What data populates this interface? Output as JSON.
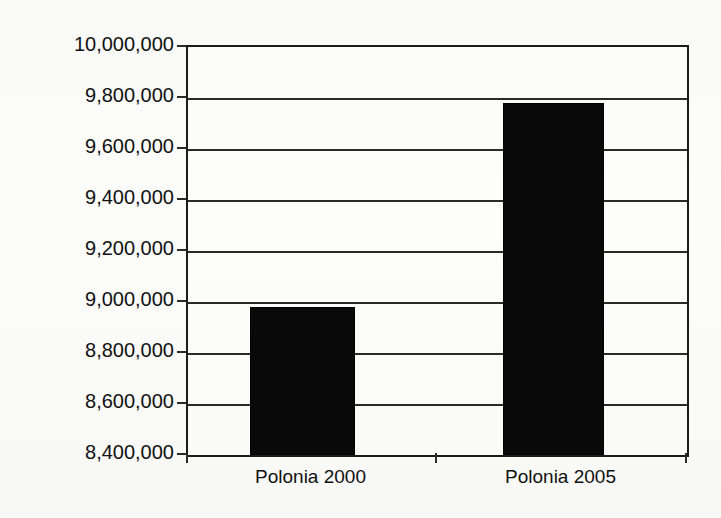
{
  "chart_data": {
    "type": "bar",
    "title": "",
    "subtitle": "",
    "xlabel": "",
    "ylabel": "",
    "categories": [
      "Polonia 2000",
      "Polonia 2005"
    ],
    "values": [
      8980000,
      9780000
    ],
    "series": [
      {
        "name": "Polonia",
        "values": [
          8980000,
          9780000
        ]
      }
    ],
    "ylim": [
      8400000,
      10000000
    ],
    "ytick_step": 200000,
    "ytick_labels": [
      "10,000,000",
      "9,800,000",
      "9,600,000",
      "9,400,000",
      "9,200,000",
      "9,000,000",
      "8,800,000",
      "8,600,000",
      "8,400,000"
    ],
    "ytick_values": [
      10000000,
      9800000,
      9600000,
      9400000,
      9200000,
      9000000,
      8800000,
      8600000,
      8400000
    ],
    "grid": true,
    "grid_axis": "y",
    "legend": false,
    "legend_position": "none",
    "bar_color": "#090909",
    "axis_color": "#2a2a2a",
    "background_color": "#fcfcfa",
    "annotations": []
  },
  "axis": {
    "y_labels": [
      "10,000,000",
      "9,800,000",
      "9,600,000",
      "9,400,000",
      "9,200,000",
      "9,000,000",
      "8,800,000",
      "8,600,000",
      "8,400,000"
    ],
    "x_labels": [
      "Polonia 2000",
      "Polonia 2005"
    ]
  }
}
